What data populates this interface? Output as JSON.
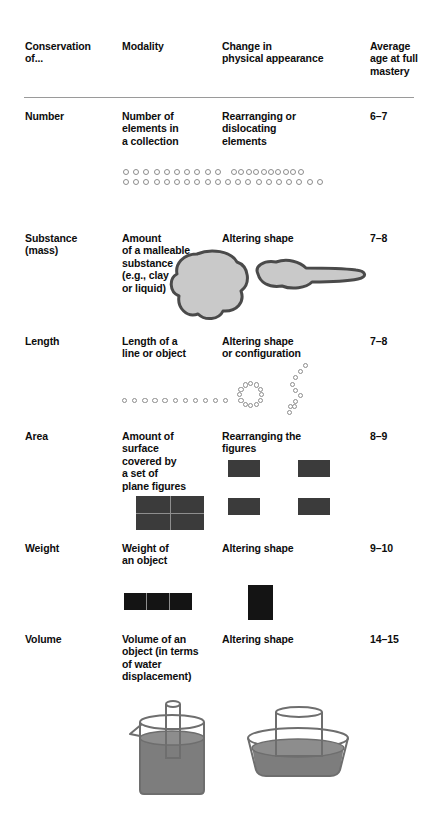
{
  "header": {
    "columns": [
      {
        "label": "Conservation\nof..."
      },
      {
        "label": "Modality"
      },
      {
        "label": "Change in\nphysical appearance"
      },
      {
        "label": "Average\nage at full\nmastery"
      }
    ]
  },
  "rows": [
    {
      "conservation": "Number",
      "modality": "Number of\nelements in\na collection",
      "change": "Rearranging or\ndislocating\nelements",
      "age": "6–7",
      "figure": "circles-rows"
    },
    {
      "conservation": "Substance\n(mass)",
      "modality": "Amount\nof a malleable\nsubstance\n(e.g., clay\nor liquid)",
      "change": "Altering shape",
      "age": "7–8",
      "figure": "clay-blobs"
    },
    {
      "conservation": "Length",
      "modality": "Length of a\nline or object",
      "change": "Altering shape\nor configuration",
      "age": "7–8",
      "figure": "circle-line-vs-ring"
    },
    {
      "conservation": "Area",
      "modality": "Amount of\nsurface\ncovered by\na set of\nplane figures",
      "change": "Rearranging the\nfigures",
      "age": "8–9",
      "figure": "squares"
    },
    {
      "conservation": "Weight",
      "modality": "Weight of\nan object",
      "change": "Altering shape",
      "age": "9–10",
      "figure": "bars"
    },
    {
      "conservation": "Volume",
      "modality": "Volume of an\nobject (in terms\nof water\ndisplacement)",
      "change": "Altering shape",
      "age": "14–15",
      "figure": "beakers"
    }
  ],
  "colors": {
    "text": "#0d0d0d",
    "rule": "#9a9a9a",
    "circle_outline": "#8d8d8d",
    "rect_fill": "#3b3b3b",
    "bar_fill": "#141414",
    "blob_fill": "#c9c9c9",
    "blob_outline": "#4a4a4a",
    "water_fill": "#7d7d7d",
    "glass_outline": "#6e6e6e"
  }
}
